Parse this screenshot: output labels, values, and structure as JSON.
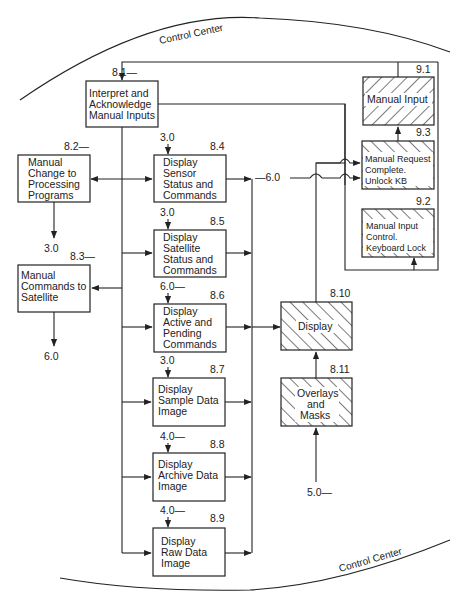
{
  "boundary": {
    "top_label": "Control Center",
    "bottom_label": "Control Center"
  },
  "nodes": {
    "n8_1": {
      "id": "8.1—",
      "lines": [
        "Interpret and",
        "Acknowledge",
        "Manual Inputs"
      ]
    },
    "n8_2": {
      "id": "8.2—",
      "lines": [
        "Manual",
        "Change to",
        "Processing",
        "Programs"
      ]
    },
    "n8_3": {
      "id": "8.3—",
      "lines": [
        "Manual",
        "Commands to",
        "Satellite"
      ]
    },
    "n8_4": {
      "id": "8.4",
      "input": "3.0",
      "lines": [
        "Display",
        "Sensor",
        "Status and",
        "Commands"
      ]
    },
    "n8_5": {
      "id": "8.5",
      "input": "3.0",
      "lines": [
        "Display",
        "Satellite",
        "Status and",
        "Commands"
      ]
    },
    "n8_6": {
      "id": "8.6",
      "input": "6.0—",
      "lines": [
        "Display",
        "Active and",
        "Pending",
        "Commands"
      ]
    },
    "n8_7": {
      "id": "8.7",
      "input": "3.0",
      "lines": [
        "Display",
        "Sample Data",
        "Image"
      ]
    },
    "n8_8": {
      "id": "8.8",
      "input": "4.0—",
      "lines": [
        "Display",
        "Archive Data",
        "Image"
      ]
    },
    "n8_9": {
      "id": "8.9",
      "input": "4.0—",
      "lines": [
        "Display",
        "Raw Data",
        "Image"
      ]
    },
    "n8_10": {
      "id": "8.10",
      "lines": [
        "Display"
      ]
    },
    "n8_11": {
      "id": "8.11",
      "input": "5.0—",
      "lines": [
        "Overlays",
        "and",
        "Masks"
      ]
    },
    "n9_1": {
      "id": "9.1",
      "lines": [
        "Manual Input"
      ]
    },
    "n9_3": {
      "id": "9.3",
      "lines": [
        "Manual Request",
        "Complete.",
        "Unlock KB"
      ]
    },
    "n9_2": {
      "id": "9.2",
      "lines": [
        "Manual Input",
        "Control.",
        "Keyboard Lock"
      ]
    }
  },
  "connectors": {
    "from_8_2_output": "3.0",
    "from_8_3_output": "6.0",
    "to_9_2_input": "—6.0"
  },
  "colors": {
    "ink": "#222222",
    "background": "#ffffff"
  }
}
